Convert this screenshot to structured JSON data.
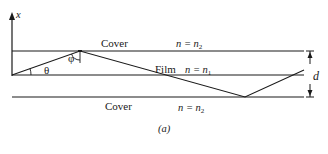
{
  "figure": {
    "caption": "(a)",
    "axis": {
      "label": "x"
    },
    "regions": {
      "top_cover": {
        "label": "Cover",
        "index_lhs": "n = n",
        "index_sub": "2"
      },
      "film": {
        "label": "Film",
        "index_lhs": "n = n",
        "index_sub": "1"
      },
      "bottom_cover": {
        "label": "Cover",
        "index_lhs": "n = n",
        "index_sub": "2"
      }
    },
    "angles": {
      "theta": "θ",
      "phi": "φ"
    },
    "thickness": {
      "label": "d"
    },
    "colors": {
      "stroke": "#1a1a1a",
      "background": "#ffffff"
    }
  }
}
